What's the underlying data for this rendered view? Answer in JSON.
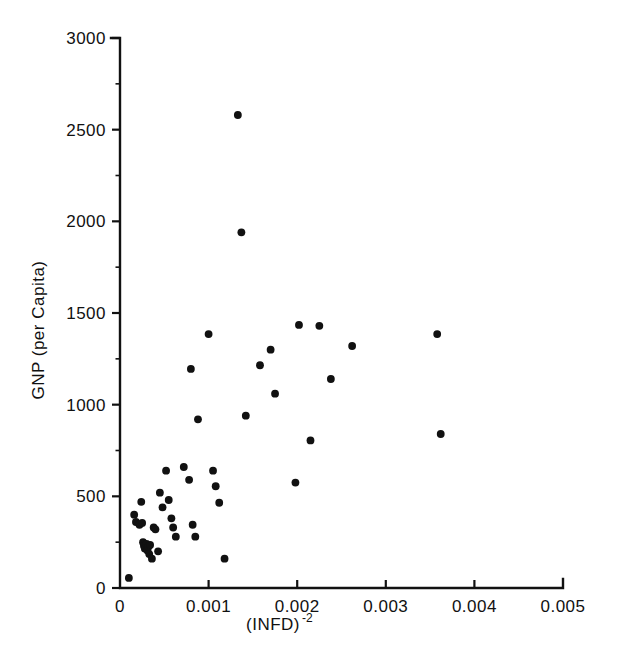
{
  "chart_data": {
    "type": "scatter",
    "title": "",
    "xlabel": "(INFD)-2",
    "xlabel_base": "(INFD)",
    "xlabel_exponent": "-2",
    "ylabel": "GNP (per Capita)",
    "xlim": [
      0,
      0.005
    ],
    "ylim": [
      0,
      3000
    ],
    "xticks": [
      0,
      0.001,
      0.002,
      0.003,
      0.004,
      0.005
    ],
    "xtick_labels": [
      "0",
      "0.001",
      "0.002",
      "0.003",
      "0.004",
      "0.005"
    ],
    "yticks": [
      0,
      500,
      1000,
      1500,
      2000,
      2500,
      3000
    ],
    "ytick_labels": [
      "0",
      "500",
      "1000",
      "1500",
      "2000",
      "2500",
      "3000"
    ],
    "grid": false,
    "legend": null,
    "marker": "filled-circle",
    "marker_color": "#111111",
    "marker_size_px": 5,
    "n_points": 52,
    "points": [
      {
        "x": 0.0001,
        "y": 55
      },
      {
        "x": 0.00016,
        "y": 400
      },
      {
        "x": 0.00018,
        "y": 360
      },
      {
        "x": 0.00022,
        "y": 345
      },
      {
        "x": 0.00024,
        "y": 470
      },
      {
        "x": 0.00025,
        "y": 355
      },
      {
        "x": 0.00026,
        "y": 250
      },
      {
        "x": 0.00027,
        "y": 230
      },
      {
        "x": 0.00028,
        "y": 215
      },
      {
        "x": 0.0003,
        "y": 240
      },
      {
        "x": 0.00031,
        "y": 205
      },
      {
        "x": 0.00032,
        "y": 225
      },
      {
        "x": 0.00033,
        "y": 185
      },
      {
        "x": 0.00034,
        "y": 235
      },
      {
        "x": 0.00036,
        "y": 160
      },
      {
        "x": 0.00038,
        "y": 330
      },
      {
        "x": 0.0004,
        "y": 320
      },
      {
        "x": 0.00043,
        "y": 200
      },
      {
        "x": 0.00045,
        "y": 520
      },
      {
        "x": 0.00048,
        "y": 440
      },
      {
        "x": 0.00052,
        "y": 640
      },
      {
        "x": 0.00055,
        "y": 480
      },
      {
        "x": 0.00058,
        "y": 380
      },
      {
        "x": 0.0006,
        "y": 330
      },
      {
        "x": 0.00063,
        "y": 280
      },
      {
        "x": 0.00072,
        "y": 660
      },
      {
        "x": 0.00078,
        "y": 590
      },
      {
        "x": 0.0008,
        "y": 1195
      },
      {
        "x": 0.00082,
        "y": 345
      },
      {
        "x": 0.00085,
        "y": 280
      },
      {
        "x": 0.00088,
        "y": 920
      },
      {
        "x": 0.001,
        "y": 1385
      },
      {
        "x": 0.00105,
        "y": 640
      },
      {
        "x": 0.00108,
        "y": 555
      },
      {
        "x": 0.00112,
        "y": 465
      },
      {
        "x": 0.00118,
        "y": 160
      },
      {
        "x": 0.00133,
        "y": 2580
      },
      {
        "x": 0.00137,
        "y": 1940
      },
      {
        "x": 0.00142,
        "y": 940
      },
      {
        "x": 0.00158,
        "y": 1215
      },
      {
        "x": 0.0017,
        "y": 1300
      },
      {
        "x": 0.00175,
        "y": 1060
      },
      {
        "x": 0.00198,
        "y": 575
      },
      {
        "x": 0.00202,
        "y": 1435
      },
      {
        "x": 0.00215,
        "y": 805
      },
      {
        "x": 0.00225,
        "y": 1430
      },
      {
        "x": 0.00238,
        "y": 1140
      },
      {
        "x": 0.00262,
        "y": 1320
      },
      {
        "x": 0.00358,
        "y": 1385
      },
      {
        "x": 0.00362,
        "y": 840
      }
    ]
  }
}
